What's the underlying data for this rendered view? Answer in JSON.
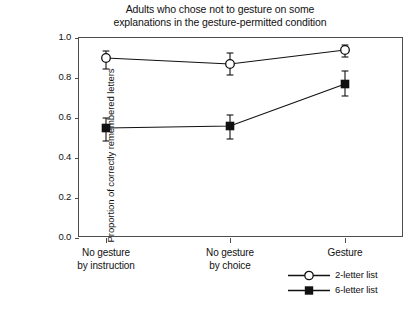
{
  "chart_data": {
    "type": "line",
    "title": "Adults who chose not to gesture on some explanations in the gesture-permitted condition",
    "title_lines": [
      "Adults who chose not to gesture on some",
      "explanations in the gesture-permitted condition"
    ],
    "xlabel": "",
    "ylabel": "Proportion of correctly remembered letters",
    "categories": [
      "No gesture by instruction",
      "No gesture by choice",
      "Gesture"
    ],
    "category_lines": [
      [
        "No gesture",
        "by instruction"
      ],
      [
        "No gesture",
        "by choice"
      ],
      [
        "Gesture",
        ""
      ]
    ],
    "ylim": [
      0.0,
      1.0
    ],
    "yticks": [
      "0.0",
      "0.2",
      "0.4",
      "0.6",
      "0.8",
      "1.0"
    ],
    "ytick_values": [
      0.0,
      0.2,
      0.4,
      0.6,
      0.8,
      1.0
    ],
    "grid": false,
    "legend_position": "bottom-right",
    "series": [
      {
        "name": "2-letter list",
        "marker": "open-circle",
        "color": "#111111",
        "values": [
          0.9,
          0.87,
          0.94
        ],
        "errors_low": [
          0.845,
          0.815,
          0.905
        ],
        "errors_high": [
          0.935,
          0.925,
          0.965
        ]
      },
      {
        "name": "6-letter list",
        "marker": "filled-square",
        "color": "#111111",
        "values": [
          0.55,
          0.56,
          0.77
        ],
        "errors_low": [
          0.485,
          0.495,
          0.71
        ],
        "errors_high": [
          0.6,
          0.615,
          0.835
        ]
      }
    ]
  },
  "legend": {
    "items": [
      {
        "label": "2-letter list",
        "marker": "open-circle"
      },
      {
        "label": "6-letter list",
        "marker": "filled-square"
      }
    ]
  },
  "colors": {
    "axis": "#4d4d4d",
    "text": "#111111",
    "marker": "#111111",
    "background": "#ffffff"
  }
}
